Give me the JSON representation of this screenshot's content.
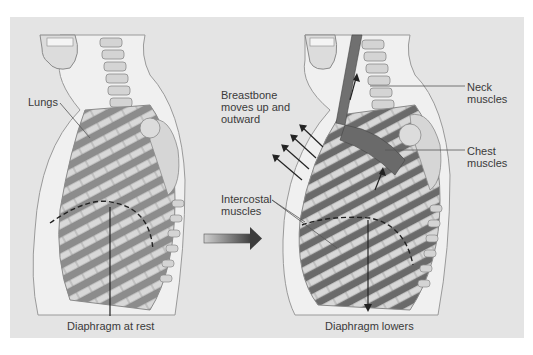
{
  "figure": {
    "panels": [
      {
        "id": "at-rest",
        "labels": {
          "lungs": "Lungs",
          "diaphragm": "Diaphragm at rest"
        }
      },
      {
        "id": "inhalation",
        "labels": {
          "breastbone": "Breastbone\nmoves up and\noutward",
          "neck_muscles": "Neck\nmuscles",
          "chest_muscles": "Chest\nmuscles",
          "intercostal": "Intercostal\nmuscles",
          "diaphragm": "Diaphragm lowers"
        }
      }
    ],
    "transition_arrow": "right-arrow",
    "colors": {
      "background": "#e4e4e4",
      "body_outline": "#f2f2f2",
      "bone": "#d6d6d6",
      "bone_edge": "#8a8a8a",
      "lung": "#8c8c8c",
      "muscle": "#6e6e6e",
      "text": "#3a3a3a"
    }
  }
}
